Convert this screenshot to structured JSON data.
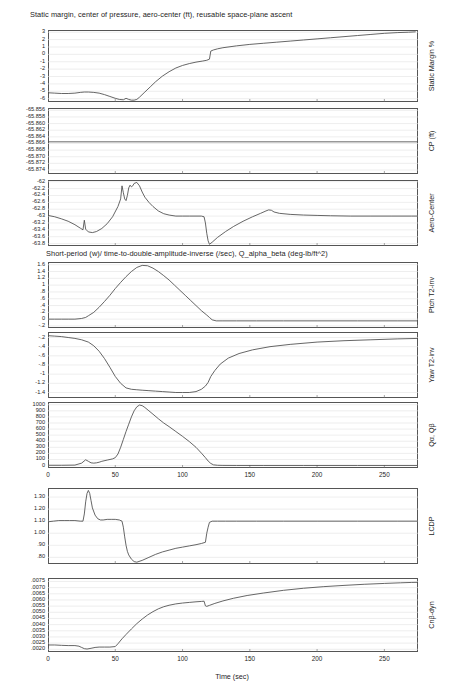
{
  "figure": {
    "width": 453,
    "height": 692,
    "background": "#ffffff",
    "line_color": "#4a4a4a",
    "frame_color": "#555555",
    "grid_color": "#e2e2e2"
  },
  "titles": {
    "group_one": "Static margin, center of pressure, aero-center (ft), reusable space-plane ascent",
    "group_two": "Short-period (w)/ time-to-double-amplitude-inverse (/sec), Q_alpha_beta (deg-lb/ft^2)"
  },
  "xaxis": {
    "label": "Time (sec)",
    "ticks": [
      "0",
      "50",
      "100",
      "150",
      "200",
      "250"
    ],
    "tick_values": [
      0,
      50,
      100,
      150,
      200,
      250
    ],
    "range": [
      0,
      275
    ]
  },
  "chart_data": [
    {
      "type": "line",
      "name": "static-margin",
      "title": "Static margin, center of pressure, aero-center (ft), reusable space-plane ascent",
      "ylabel": "Static Margin %",
      "xlabel": "Time (sec)",
      "ytick_labels": [
        "3",
        "2",
        "1",
        "0",
        "-1",
        "-2",
        "-3",
        "-4",
        "-5",
        "-6"
      ],
      "ytick_values": [
        3,
        2,
        1,
        0,
        -1,
        -2,
        -3,
        -4,
        -5,
        -6
      ],
      "ylim": [
        -6.45,
        3.3
      ],
      "xlim": [
        0,
        275
      ],
      "grid": true,
      "x": [
        0,
        5,
        10,
        15,
        20,
        24,
        27,
        30,
        34,
        38,
        42,
        46,
        50,
        53,
        56,
        58,
        60,
        62,
        64,
        66,
        68,
        72,
        76,
        80,
        85,
        90,
        95,
        100,
        105,
        110,
        115,
        118,
        120,
        121,
        123,
        126,
        130,
        140,
        150,
        160,
        170,
        180,
        190,
        200,
        210,
        220,
        230,
        240,
        250,
        260,
        268,
        273
      ],
      "y": [
        -5.2,
        -5.25,
        -5.3,
        -5.3,
        -5.25,
        -5.15,
        -5.1,
        -5.1,
        -5.15,
        -5.25,
        -5.45,
        -5.7,
        -5.95,
        -6.1,
        -6.15,
        -5.95,
        -6.1,
        -6.2,
        -6.2,
        -6.1,
        -5.8,
        -5.1,
        -4.4,
        -3.7,
        -2.95,
        -2.35,
        -1.85,
        -1.5,
        -1.25,
        -1.05,
        -0.9,
        -0.8,
        -0.65,
        0.45,
        0.6,
        0.75,
        0.9,
        1.15,
        1.35,
        1.5,
        1.65,
        1.8,
        1.95,
        2.1,
        2.25,
        2.4,
        2.55,
        2.7,
        2.85,
        2.95,
        3.0,
        3.05
      ]
    },
    {
      "type": "line",
      "name": "center-of-pressure",
      "ylabel": "CP (ft)",
      "xlabel": "Time (sec)",
      "ytick_labels": [
        "-65.856",
        "-65.858",
        "-65.860",
        "-65.862",
        "-65.864",
        "-65.866",
        "-65.868",
        "-65.870",
        "-65.872",
        "-65.874"
      ],
      "ytick_values": [
        -65.856,
        -65.858,
        -65.86,
        -65.862,
        -65.864,
        -65.866,
        -65.868,
        -65.87,
        -65.872,
        -65.874
      ],
      "ylim": [
        -65.8752,
        -65.8553
      ],
      "xlim": [
        0,
        275
      ],
      "grid": true,
      "x": [
        0,
        275
      ],
      "y": [
        -65.8655,
        -65.8655
      ]
    },
    {
      "type": "line",
      "name": "aero-center",
      "ylabel": "Aero-Center",
      "xlabel": "Time (sec)",
      "ytick_labels": [
        "-62",
        "-62.2",
        "-62.4",
        "-62.6",
        "-62.8",
        "-63",
        "-63.2",
        "-63.4",
        "-63.6",
        "-63.8"
      ],
      "ytick_values": [
        -62,
        -62.2,
        -62.4,
        -62.6,
        -62.8,
        -63,
        -63.2,
        -63.4,
        -63.6,
        -63.8
      ],
      "ylim": [
        -63.87,
        -61.95
      ],
      "xlim": [
        0,
        275
      ],
      "grid": true,
      "x": [
        0,
        5,
        10,
        15,
        20,
        24,
        26,
        27,
        28,
        30,
        33,
        36,
        40,
        44,
        48,
        52,
        54,
        55,
        56,
        57,
        58,
        59,
        60,
        61,
        62,
        63,
        64,
        66,
        68,
        70,
        72,
        75,
        78,
        82,
        86,
        90,
        95,
        100,
        105,
        110,
        114,
        116,
        117,
        118,
        119,
        120,
        122,
        126,
        132,
        138,
        145,
        152,
        158,
        162,
        164,
        166,
        168,
        172,
        180,
        190,
        200,
        210,
        225,
        240,
        255,
        270,
        275
      ],
      "y": [
        -62.98,
        -63.02,
        -63.08,
        -63.15,
        -63.25,
        -63.35,
        -63.4,
        -63.12,
        -63.38,
        -63.46,
        -63.48,
        -63.45,
        -63.36,
        -63.22,
        -63.02,
        -62.72,
        -62.5,
        -62.12,
        -62.32,
        -62.5,
        -62.55,
        -62.4,
        -62.18,
        -62.1,
        -62.15,
        -62.12,
        -62.05,
        -62.02,
        -62.12,
        -62.3,
        -62.45,
        -62.6,
        -62.72,
        -62.85,
        -62.93,
        -62.97,
        -63.0,
        -63.0,
        -63.0,
        -63.0,
        -63.0,
        -63.02,
        -63.2,
        -63.5,
        -63.72,
        -63.82,
        -63.76,
        -63.62,
        -63.45,
        -63.3,
        -63.15,
        -63.02,
        -62.92,
        -62.85,
        -62.82,
        -62.83,
        -62.88,
        -62.92,
        -62.95,
        -62.97,
        -62.98,
        -62.99,
        -63.0,
        -63.0,
        -63.0,
        -63.0,
        -63.0
      ]
    },
    {
      "type": "line",
      "name": "pitch-t2-inverse",
      "title": "Short-period (w)/ time-to-double-amplitude-inverse (/sec), Q_alpha_beta (deg-lb/ft^2)",
      "ylabel": "Ptch T2-inv",
      "xlabel": "Time (sec)",
      "ytick_labels": [
        "1.6",
        "1.4",
        "1.2",
        "1",
        ".8",
        ".6",
        ".4",
        ".2",
        "0",
        "-.2"
      ],
      "ytick_values": [
        1.6,
        1.4,
        1.2,
        1.0,
        0.8,
        0.6,
        0.4,
        0.2,
        0,
        -0.2
      ],
      "ylim": [
        -0.26,
        1.68
      ],
      "xlim": [
        0,
        275
      ],
      "grid": true,
      "x": [
        0,
        5,
        10,
        15,
        20,
        25,
        28,
        30,
        34,
        38,
        42,
        46,
        50,
        54,
        58,
        62,
        66,
        70,
        74,
        78,
        82,
        86,
        90,
        94,
        98,
        102,
        106,
        110,
        114,
        118,
        120,
        122,
        125,
        130,
        140,
        155,
        175,
        200,
        230,
        260,
        275
      ],
      "y": [
        0.0,
        0.0,
        0.0,
        0.0,
        0.0,
        0.02,
        0.05,
        0.1,
        0.2,
        0.35,
        0.52,
        0.7,
        0.9,
        1.08,
        1.25,
        1.4,
        1.52,
        1.58,
        1.57,
        1.5,
        1.4,
        1.28,
        1.15,
        1.0,
        0.85,
        0.7,
        0.55,
        0.4,
        0.25,
        0.12,
        0.05,
        -0.02,
        -0.05,
        -0.05,
        -0.05,
        -0.05,
        -0.05,
        -0.05,
        -0.05,
        -0.05,
        -0.05
      ]
    },
    {
      "type": "line",
      "name": "yaw-t2-inverse",
      "ylabel": "Yaw T2-inv",
      "xlabel": "Time (sec)",
      "ytick_labels": [
        "-.2",
        "-.4",
        "-.6",
        "-.8",
        "-1",
        "-1.2",
        "-1.4"
      ],
      "ytick_values": [
        -0.2,
        -0.4,
        -0.6,
        -0.8,
        -1.0,
        -1.2,
        -1.4
      ],
      "ylim": [
        -1.52,
        -0.08
      ],
      "xlim": [
        0,
        275
      ],
      "grid": true,
      "x": [
        0,
        5,
        10,
        15,
        20,
        25,
        30,
        34,
        38,
        42,
        46,
        50,
        54,
        58,
        62,
        66,
        70,
        75,
        80,
        85,
        90,
        95,
        100,
        105,
        110,
        114,
        117,
        119,
        121,
        124,
        128,
        134,
        142,
        152,
        165,
        180,
        200,
        220,
        240,
        260,
        275
      ],
      "y": [
        -0.16,
        -0.17,
        -0.18,
        -0.2,
        -0.22,
        -0.25,
        -0.3,
        -0.38,
        -0.5,
        -0.66,
        -0.85,
        -1.05,
        -1.2,
        -1.3,
        -1.33,
        -1.34,
        -1.35,
        -1.36,
        -1.37,
        -1.38,
        -1.39,
        -1.4,
        -1.4,
        -1.4,
        -1.38,
        -1.33,
        -1.26,
        -1.18,
        -1.05,
        -0.92,
        -0.78,
        -0.65,
        -0.55,
        -0.47,
        -0.4,
        -0.35,
        -0.3,
        -0.27,
        -0.25,
        -0.23,
        -0.22
      ]
    },
    {
      "type": "line",
      "name": "q-alpha-q-beta",
      "ylabel": "Qα, Qβ",
      "xlabel": "Time (sec)",
      "ytick_labels": [
        "1000",
        "900",
        "800",
        "700",
        "600",
        "500",
        "400",
        "300",
        "200",
        "100",
        "0"
      ],
      "ytick_values": [
        1000,
        900,
        800,
        700,
        600,
        500,
        400,
        300,
        200,
        100,
        0
      ],
      "ylim": [
        -40,
        1045
      ],
      "xlim": [
        0,
        275
      ],
      "grid": true,
      "x": [
        0,
        10,
        20,
        25,
        28,
        30,
        32,
        34,
        36,
        38,
        40,
        44,
        48,
        50,
        52,
        54,
        56,
        58,
        60,
        62,
        64,
        66,
        68,
        70,
        72,
        75,
        78,
        82,
        86,
        90,
        95,
        100,
        105,
        110,
        114,
        117,
        119,
        121,
        123,
        126,
        130,
        140,
        160,
        190,
        230,
        275
      ],
      "y": [
        5,
        5,
        8,
        40,
        95,
        70,
        45,
        40,
        45,
        55,
        70,
        90,
        110,
        130,
        190,
        300,
        430,
        560,
        680,
        800,
        900,
        965,
        995,
        985,
        955,
        900,
        845,
        770,
        700,
        640,
        560,
        480,
        395,
        300,
        205,
        130,
        75,
        35,
        12,
        5,
        3,
        2,
        2,
        2,
        2,
        2
      ]
    },
    {
      "type": "line",
      "name": "lcdp",
      "ylabel": "LCDP",
      "xlabel": "Time (sec)",
      "ytick_labels": [
        "1.30",
        "1.20",
        "1.10",
        "1.00",
        ".90",
        ".80"
      ],
      "ytick_values": [
        1.3,
        1.2,
        1.1,
        1.0,
        0.9,
        0.8
      ],
      "ylim": [
        0.745,
        1.375
      ],
      "xlim": [
        0,
        275
      ],
      "grid": true,
      "x": [
        0,
        4,
        8,
        12,
        16,
        20,
        24,
        26,
        27,
        28,
        29,
        30,
        31,
        32,
        33,
        35,
        37,
        39,
        41,
        44,
        47,
        50,
        53,
        55,
        56,
        57,
        58,
        59,
        60,
        62,
        64,
        66,
        70,
        75,
        80,
        85,
        90,
        95,
        100,
        105,
        110,
        114,
        117,
        118,
        119,
        120,
        122,
        126,
        132,
        140,
        155,
        175,
        200,
        230,
        260,
        275
      ],
      "y": [
        1.095,
        1.1,
        1.105,
        1.105,
        1.105,
        1.105,
        1.1,
        1.1,
        1.16,
        1.26,
        1.33,
        1.355,
        1.33,
        1.27,
        1.21,
        1.15,
        1.12,
        1.11,
        1.11,
        1.115,
        1.115,
        1.115,
        1.11,
        1.1,
        1.05,
        0.97,
        0.9,
        0.85,
        0.82,
        0.785,
        0.765,
        0.76,
        0.775,
        0.8,
        0.825,
        0.845,
        0.86,
        0.875,
        0.885,
        0.895,
        0.905,
        0.915,
        0.925,
        1.0,
        1.05,
        1.09,
        1.1,
        1.1,
        1.1,
        1.1,
        1.1,
        1.1,
        1.1,
        1.1,
        1.1,
        1.1
      ]
    },
    {
      "type": "line",
      "name": "cn-beta-dyn",
      "ylabel": "Cnβ-dyn",
      "xlabel": "Time (sec)",
      "ytick_labels": [
        ".0075",
        ".0070",
        ".0065",
        ".0060",
        ".0055",
        ".0050",
        ".0045",
        ".0040",
        ".0035",
        ".0030",
        ".0025",
        ".0020"
      ],
      "ytick_values": [
        0.0075,
        0.007,
        0.0065,
        0.006,
        0.0055,
        0.005,
        0.0045,
        0.004,
        0.0035,
        0.003,
        0.0025,
        0.002
      ],
      "ylim": [
        0.00178,
        0.00778
      ],
      "xlim": [
        0,
        275
      ],
      "grid": true,
      "x": [
        0,
        5,
        10,
        15,
        20,
        23,
        25,
        27,
        29,
        32,
        35,
        38,
        42,
        46,
        50,
        52,
        55,
        58,
        62,
        66,
        70,
        74,
        78,
        82,
        86,
        90,
        95,
        100,
        105,
        110,
        114,
        116,
        117,
        118,
        120,
        124,
        130,
        138,
        148,
        160,
        175,
        190,
        205,
        220,
        235,
        250,
        262,
        270,
        275
      ],
      "y": [
        0.00235,
        0.00235,
        0.00232,
        0.0023,
        0.0023,
        0.00225,
        0.00215,
        0.00205,
        0.00202,
        0.00208,
        0.00215,
        0.00218,
        0.00218,
        0.00218,
        0.00222,
        0.00245,
        0.00285,
        0.0032,
        0.00365,
        0.00408,
        0.00445,
        0.00478,
        0.00505,
        0.00528,
        0.00545,
        0.00557,
        0.00568,
        0.00575,
        0.0058,
        0.00585,
        0.00588,
        0.0059,
        0.00552,
        0.00548,
        0.00556,
        0.00572,
        0.00592,
        0.00614,
        0.00636,
        0.00656,
        0.00678,
        0.00695,
        0.00708,
        0.00718,
        0.00727,
        0.00734,
        0.00739,
        0.00742,
        0.00743
      ]
    }
  ]
}
